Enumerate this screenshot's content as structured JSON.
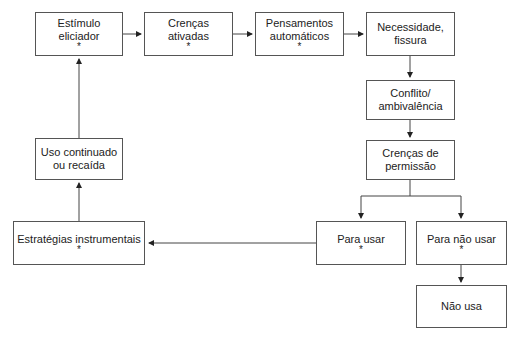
{
  "diagram": {
    "nodes": [
      {
        "id": "estimulo",
        "lines": [
          "Estímulo",
          "eliciador"
        ],
        "star": "*"
      },
      {
        "id": "crencas_ativadas",
        "lines": [
          "Crenças",
          "ativadas"
        ],
        "star": "*"
      },
      {
        "id": "pensamentos",
        "lines": [
          "Pensamentos",
          "automáticos"
        ],
        "star": "*"
      },
      {
        "id": "necessidade",
        "lines": [
          "Necessidade,",
          "fissura"
        ],
        "star": ""
      },
      {
        "id": "conflito",
        "lines": [
          "Conflito/",
          "ambivalência"
        ],
        "star": ""
      },
      {
        "id": "permissao",
        "lines": [
          "Crenças de",
          "permissão"
        ],
        "star": ""
      },
      {
        "id": "uso_continuado",
        "lines": [
          "Uso continuado",
          "ou recaída"
        ],
        "star": ""
      },
      {
        "id": "estrategias",
        "lines": [
          "Estratégias instrumentais",
          ""
        ],
        "star": "*"
      },
      {
        "id": "para_usar",
        "lines": [
          "Para usar",
          ""
        ],
        "star": "*"
      },
      {
        "id": "para_nao_usar",
        "lines": [
          "Para não usar",
          ""
        ],
        "star": "*"
      },
      {
        "id": "nao_usa",
        "lines": [
          "Não usa",
          ""
        ],
        "star": ""
      }
    ],
    "edges": [
      [
        "estimulo",
        "crencas_ativadas"
      ],
      [
        "crencas_ativadas",
        "pensamentos"
      ],
      [
        "pensamentos",
        "necessidade"
      ],
      [
        "necessidade",
        "conflito"
      ],
      [
        "conflito",
        "permissao"
      ],
      [
        "permissao",
        "para_usar"
      ],
      [
        "permissao",
        "para_nao_usar"
      ],
      [
        "para_nao_usar",
        "nao_usa"
      ],
      [
        "para_usar",
        "estrategias"
      ],
      [
        "estrategias",
        "uso_continuado"
      ],
      [
        "uso_continuado",
        "estimulo"
      ]
    ],
    "colors": {
      "line": "#333333",
      "border": "#555555",
      "text": "#222222"
    }
  }
}
